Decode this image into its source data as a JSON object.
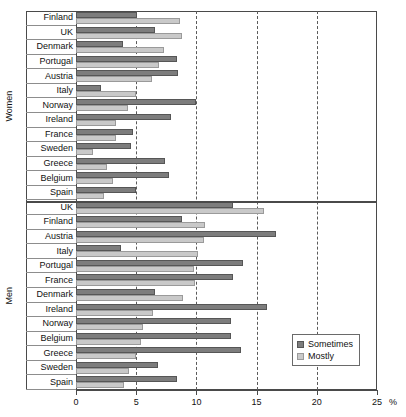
{
  "chart_data": {
    "type": "bar",
    "orientation": "horizontal",
    "title": "",
    "xlabel": "%",
    "ylabel": "",
    "xlim": [
      0,
      25
    ],
    "xticks": [
      0,
      5,
      10,
      15,
      20,
      25
    ],
    "xtick_labels": [
      "0",
      "5",
      "10",
      "15",
      "20",
      "25"
    ],
    "grid": "vertical-dashed",
    "legend_position": "bottom-right",
    "legend": [
      "Sometimes",
      "Mostly"
    ],
    "series": [
      {
        "name": "Sometimes",
        "color": "#7d7d7d"
      },
      {
        "name": "Mostly",
        "color": "#c9c9c9"
      }
    ],
    "groups": [
      {
        "label": "Women",
        "categories": [
          "Finland",
          "UK",
          "Denmark",
          "Portugal",
          "Austria",
          "Italy",
          "Norway",
          "Ireland",
          "France",
          "Sweden",
          "Greece",
          "Belgium",
          "Spain"
        ],
        "values": {
          "Sometimes": [
            5.1,
            6.6,
            3.9,
            8.4,
            8.5,
            2.1,
            10.0,
            7.9,
            4.7,
            4.6,
            7.4,
            7.7,
            5.0
          ],
          "Mostly": [
            8.6,
            8.8,
            7.3,
            6.9,
            6.3,
            5.0,
            4.3,
            3.3,
            3.3,
            1.4,
            2.6,
            3.1,
            2.3
          ]
        }
      },
      {
        "label": "Men",
        "categories": [
          "UK",
          "Finland",
          "Austria",
          "Italy",
          "Portugal",
          "France",
          "Denmark",
          "Ireland",
          "Norway",
          "Belgium",
          "Greece",
          "Sweden",
          "Spain"
        ],
        "values": {
          "Sometimes": [
            13.0,
            8.8,
            16.6,
            3.7,
            13.9,
            13.0,
            6.6,
            15.9,
            12.9,
            12.9,
            13.7,
            6.8,
            8.4
          ],
          "Mostly": [
            15.6,
            10.7,
            10.6,
            10.1,
            9.8,
            9.9,
            8.9,
            6.4,
            5.6,
            5.4,
            5.0,
            4.4,
            4.0
          ]
        }
      }
    ]
  },
  "axis": {
    "unit": "%"
  }
}
